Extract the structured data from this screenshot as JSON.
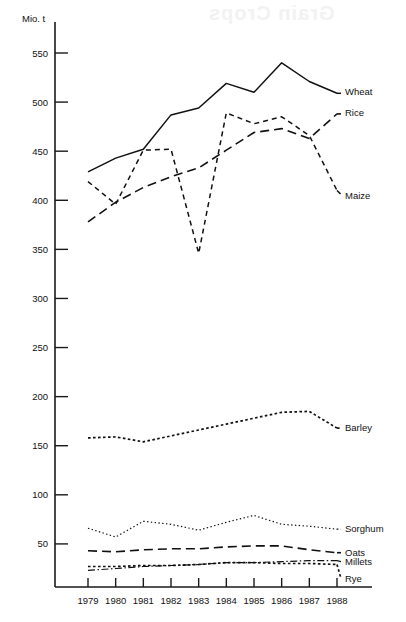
{
  "chart_data": {
    "type": "line",
    "title": "",
    "xlabel": "",
    "ylabel": "Mio. t",
    "unit_label": "Mio. t",
    "x": [
      1979,
      1980,
      1981,
      1982,
      1983,
      1984,
      1985,
      1986,
      1987,
      1988
    ],
    "categories": [
      "1979",
      "1980",
      "1981",
      "1982",
      "1983",
      "1984",
      "1985",
      "1986",
      "1987",
      "1988"
    ],
    "ylim": [
      0,
      565
    ],
    "yticks": [
      50,
      100,
      150,
      200,
      250,
      300,
      350,
      400,
      450,
      500,
      550
    ],
    "ytick_labels": [
      "50",
      "100",
      "150",
      "200",
      "250",
      "300",
      "350",
      "400",
      "450",
      "500",
      "550"
    ],
    "grid": false,
    "legend_position": "right-inline-labels",
    "series": [
      {
        "name": "Wheat",
        "label": "Wheat",
        "dash": "solid",
        "values": [
          429,
          443,
          452,
          487,
          494,
          519,
          510,
          540,
          521,
          509
        ]
      },
      {
        "name": "Rice",
        "label": "Rice",
        "dash": "long-dash",
        "values": [
          378,
          398,
          413,
          424,
          433,
          451,
          469,
          473,
          463,
          488
        ]
      },
      {
        "name": "Maize",
        "label": "Maize",
        "dash": "short-dash",
        "values": [
          419,
          396,
          451,
          452,
          346,
          489,
          478,
          485,
          466,
          410
        ]
      },
      {
        "name": "Barley",
        "label": "Barley",
        "dash": "dotted",
        "values": [
          158,
          159,
          154,
          160,
          166,
          172,
          178,
          184,
          185,
          168
        ]
      },
      {
        "name": "Sorghum",
        "label": "Sorghum",
        "dash": "fine-dotted",
        "values": [
          66,
          57,
          73,
          70,
          64,
          72,
          79,
          70,
          68,
          65
        ]
      },
      {
        "name": "Oats",
        "label": "Oats",
        "dash": "long-dash",
        "values": [
          43,
          42,
          44,
          45,
          45,
          47,
          48,
          48,
          44,
          41
        ]
      },
      {
        "name": "Millets",
        "label": "Millets",
        "dash": "dash-dot",
        "values": [
          23,
          25,
          27,
          28,
          29,
          31,
          31,
          32,
          33,
          33
        ]
      },
      {
        "name": "Rye",
        "label": "Rye",
        "dash": "dotted",
        "values": [
          27,
          27,
          28,
          28,
          29,
          31,
          31,
          30,
          30,
          29
        ]
      }
    ]
  },
  "axis": {
    "unit": "Mio. t"
  },
  "watermark": {
    "text": "Grain Crops"
  }
}
